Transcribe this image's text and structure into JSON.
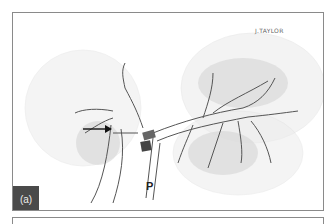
{
  "figure": {
    "panel_label": "(a)",
    "signature": "J.TAYLOR",
    "annotation_letter": "P",
    "arrow": "arrow-right",
    "colors": {
      "border": "#8a8a8a",
      "badge_bg": "#4a4a4a",
      "badge_text": "#eeeeee",
      "line_ink": "#555555",
      "shading": "#cfcfcf"
    }
  }
}
